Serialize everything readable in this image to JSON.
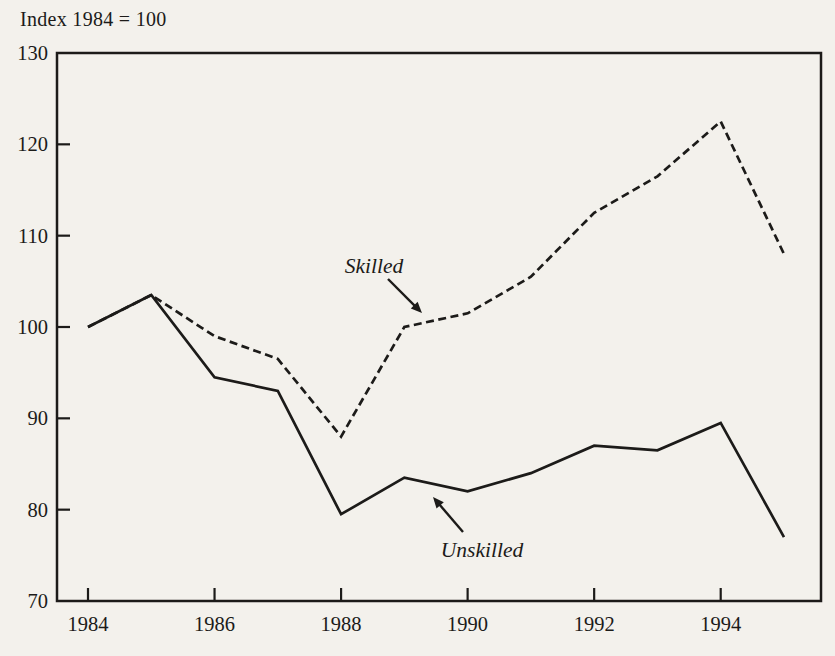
{
  "chart_data": {
    "type": "line",
    "title": "Index 1984 = 100",
    "xlabel": "",
    "ylabel": "Index 1984 = 100",
    "x": [
      1984,
      1985,
      1986,
      1987,
      1988,
      1989,
      1990,
      1991,
      1992,
      1993,
      1994,
      1995
    ],
    "series": [
      {
        "name": "Unskilled",
        "style": "solid",
        "values": [
          100,
          103.5,
          94.5,
          93,
          79.5,
          83.5,
          82,
          84,
          87,
          86.5,
          89.5,
          77
        ]
      },
      {
        "name": "Skilled",
        "style": "dashed",
        "values": [
          100,
          103.5,
          99,
          96.5,
          88,
          100,
          101.5,
          105.5,
          112.5,
          116.5,
          122.5,
          108
        ]
      }
    ],
    "ylim": [
      70,
      130
    ],
    "yticks": [
      70,
      80,
      90,
      100,
      110,
      120,
      130
    ],
    "xticks": [
      1984,
      1986,
      1988,
      1990,
      1992,
      1994
    ],
    "grid": false,
    "legend_position": "inline-annotations",
    "ink_color": "#1c1b19",
    "background_color": "#f3f1ec",
    "annotations": [
      {
        "text": "Skilled",
        "x": 374,
        "y": 266,
        "arrow": {
          "x1": 388,
          "y1": 279,
          "x2": 422,
          "y2": 313
        }
      },
      {
        "text": "Unskilled",
        "x": 482,
        "y": 550,
        "arrow": {
          "x1": 463,
          "y1": 532,
          "x2": 433,
          "y2": 497
        }
      }
    ]
  }
}
